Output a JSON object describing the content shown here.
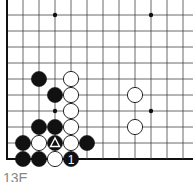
{
  "diagram": {
    "type": "go-board-fragment",
    "grid": {
      "origin_x": 7,
      "origin_y": 15,
      "spacing": 16,
      "columns": 12,
      "rows": 10,
      "left_edge": true,
      "bottom_edge": true,
      "line_color": "#444444",
      "edge_color": "#111111"
    },
    "hoshi": [
      {
        "col": 3,
        "row": 0
      },
      {
        "col": 9,
        "row": 0
      },
      {
        "col": 3,
        "row": 6
      },
      {
        "col": 9,
        "row": 6
      }
    ],
    "stones": [
      {
        "col": 2,
        "row": 4,
        "color": "black"
      },
      {
        "col": 4,
        "row": 4,
        "color": "white"
      },
      {
        "col": 3,
        "row": 5,
        "color": "black"
      },
      {
        "col": 4,
        "row": 5,
        "color": "white"
      },
      {
        "col": 8,
        "row": 5,
        "color": "white"
      },
      {
        "col": 4,
        "row": 6,
        "color": "white"
      },
      {
        "col": 2,
        "row": 7,
        "color": "black"
      },
      {
        "col": 3,
        "row": 7,
        "color": "black"
      },
      {
        "col": 4,
        "row": 7,
        "color": "white"
      },
      {
        "col": 8,
        "row": 7,
        "color": "white"
      },
      {
        "col": 1,
        "row": 8,
        "color": "black"
      },
      {
        "col": 2,
        "row": 8,
        "color": "white"
      },
      {
        "col": 3,
        "row": 8,
        "color": "black",
        "mark": "triangle"
      },
      {
        "col": 4,
        "row": 8,
        "color": "white"
      },
      {
        "col": 5,
        "row": 8,
        "color": "black"
      },
      {
        "col": 1,
        "row": 9,
        "color": "black"
      },
      {
        "col": 2,
        "row": 9,
        "color": "black"
      },
      {
        "col": 3,
        "row": 9,
        "color": "white"
      },
      {
        "col": 4,
        "row": 9,
        "color": "black",
        "label": "1"
      }
    ],
    "caption": "13E"
  }
}
